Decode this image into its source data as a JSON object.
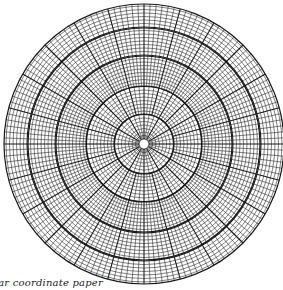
{
  "figure": {
    "type": "polar-coordinate-graph-paper",
    "caption_fragment": "Polar coordinate paper",
    "center": {
      "x": 144,
      "y": 144
    },
    "outer_radius": 140,
    "center_hole_radius": 5,
    "ring_spacing": 3.5,
    "heavy_ring_radii": [
      30,
      58,
      88,
      116,
      140
    ],
    "radial_zones": [
      {
        "from_radius": 5,
        "to_radius": 30,
        "divisions": 36
      },
      {
        "from_radius": 30,
        "to_radius": 58,
        "divisions": 72
      },
      {
        "from_radius": 58,
        "to_radius": 140,
        "divisions": 144
      }
    ],
    "heavy_radial_every_degrees": 15,
    "colors": {
      "line": "#1a1a1a",
      "background": "#ffffff"
    }
  }
}
